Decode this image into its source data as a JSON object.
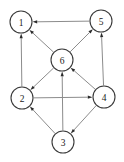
{
  "figure": {
    "type": "directed-graph",
    "background_color": "#ffffff",
    "node_fill_color": "#ffffff",
    "node_stroke_color": "#3a3a3a",
    "edge_color": "#8c8c8c",
    "arrowhead_color": "#2b2b2b",
    "label_color": "#1a1a1a",
    "width": 124,
    "height": 162,
    "node_radius": 11
  },
  "nodes": [
    {
      "id": "1",
      "label": "1",
      "cx": 21,
      "cy": 22
    },
    {
      "id": "5",
      "label": "5",
      "cx": 101,
      "cy": 21
    },
    {
      "id": "6",
      "label": "6",
      "cx": 62,
      "cy": 60
    },
    {
      "id": "2",
      "label": "2",
      "cx": 22,
      "cy": 98
    },
    {
      "id": "4",
      "label": "4",
      "cx": 104,
      "cy": 97
    },
    {
      "id": "3",
      "label": "3",
      "cx": 63,
      "cy": 142
    }
  ],
  "edges": [
    {
      "from": "5",
      "to": "1",
      "directed": true
    },
    {
      "from": "6",
      "to": "1",
      "directed": true
    },
    {
      "from": "2",
      "to": "1",
      "directed": true
    },
    {
      "from": "6",
      "to": "5",
      "directed": true
    },
    {
      "from": "4",
      "to": "5",
      "directed": true
    },
    {
      "from": "6",
      "to": "2",
      "directed": true
    },
    {
      "from": "3",
      "to": "2",
      "directed": true
    },
    {
      "from": "2",
      "to": "4",
      "directed": true
    },
    {
      "from": "4",
      "to": "6",
      "directed": true
    },
    {
      "from": "3",
      "to": "6",
      "directed": true
    },
    {
      "from": "4",
      "to": "3",
      "directed": true
    }
  ]
}
